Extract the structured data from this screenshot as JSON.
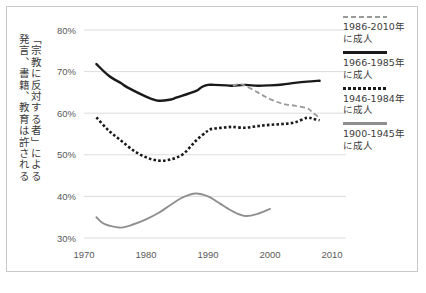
{
  "axis_title": {
    "line1": "「宗教に反対する者」による",
    "line2": "発言、書籍、教育は許される"
  },
  "legend": {
    "items": [
      {
        "label": "1986-2010年\nに成人",
        "style": "dash-gray",
        "color": "#9a9a9a"
      },
      {
        "label": "1966-1985年\nに成人",
        "style": "solid-black",
        "color": "#1a1a1a"
      },
      {
        "label": "1946-1984年\nに成人",
        "style": "dot-black",
        "color": "#1a1a1a"
      },
      {
        "label": "1900-1945年\nに成人",
        "style": "solid-gray",
        "color": "#8f8f8f"
      }
    ]
  },
  "chart_data": {
    "type": "line",
    "title": "",
    "xlabel": "",
    "ylabel": "「宗教に反対する者」による発言、書籍、教育は許される",
    "xlim": [
      1968,
      2012
    ],
    "ylim": [
      30,
      80
    ],
    "xticks": [
      1970,
      1980,
      1990,
      2000,
      2010
    ],
    "xtick_labels": [
      "1970",
      "1980",
      "1990",
      "2000",
      "2010"
    ],
    "yticks": [
      30,
      40,
      50,
      60,
      70,
      80
    ],
    "ytick_labels": [
      "30%",
      "40%",
      "50%",
      "60%",
      "70%",
      "80%"
    ],
    "grid": "horizontal",
    "legend_position": "right",
    "series": [
      {
        "name": "1966-1985年に成人",
        "style": "solid-black",
        "color": "#1a1a1a",
        "x": [
          1972,
          1974,
          1976,
          1977,
          1980,
          1982,
          1984,
          1985,
          1988,
          1989,
          1990,
          1991,
          1993,
          1994,
          1996,
          1998,
          2000,
          2002,
          2004,
          2006,
          2008
        ],
        "y": [
          71.8,
          69.0,
          67.2,
          66.2,
          64.0,
          63.0,
          63.3,
          63.8,
          65.3,
          66.3,
          66.8,
          66.8,
          66.7,
          66.6,
          66.8,
          66.6,
          66.7,
          66.9,
          67.3,
          67.6,
          67.8
        ]
      },
      {
        "name": "1946-1984年に成人",
        "style": "dot-black",
        "color": "#1a1a1a",
        "x": [
          1972,
          1974,
          1976,
          1978,
          1980,
          1982,
          1984,
          1986,
          1988,
          1990,
          1991,
          1993,
          1994,
          1996,
          1998,
          2000,
          2002,
          2004,
          2006,
          2007,
          2008
        ],
        "y": [
          59.0,
          55.8,
          53.4,
          51.0,
          49.4,
          48.6,
          48.9,
          50.2,
          53.3,
          55.8,
          56.3,
          56.6,
          56.7,
          56.5,
          56.9,
          57.2,
          57.4,
          57.8,
          58.9,
          58.6,
          58.3
        ]
      },
      {
        "name": "1986-2010年に成人",
        "style": "dash-gray",
        "color": "#9a9a9a",
        "x": [
          1994,
          1995,
          1996,
          1998,
          2000,
          2002,
          2004,
          2006,
          2007,
          2008
        ],
        "y": [
          66.6,
          67.0,
          66.6,
          65.0,
          63.4,
          62.3,
          61.8,
          61.2,
          60.0,
          58.9
        ]
      },
      {
        "name": "1900-1945年に成人",
        "style": "solid-gray",
        "color": "#8f8f8f",
        "x": [
          1972,
          1973,
          1974,
          1976,
          1978,
          1980,
          1982,
          1984,
          1986,
          1988,
          1990,
          1992,
          1994,
          1996,
          1998,
          2000
        ],
        "y": [
          35.0,
          33.6,
          33.0,
          32.5,
          33.3,
          34.5,
          36.0,
          38.0,
          39.8,
          40.7,
          40.0,
          38.2,
          36.4,
          35.3,
          35.8,
          37.0
        ]
      }
    ]
  }
}
